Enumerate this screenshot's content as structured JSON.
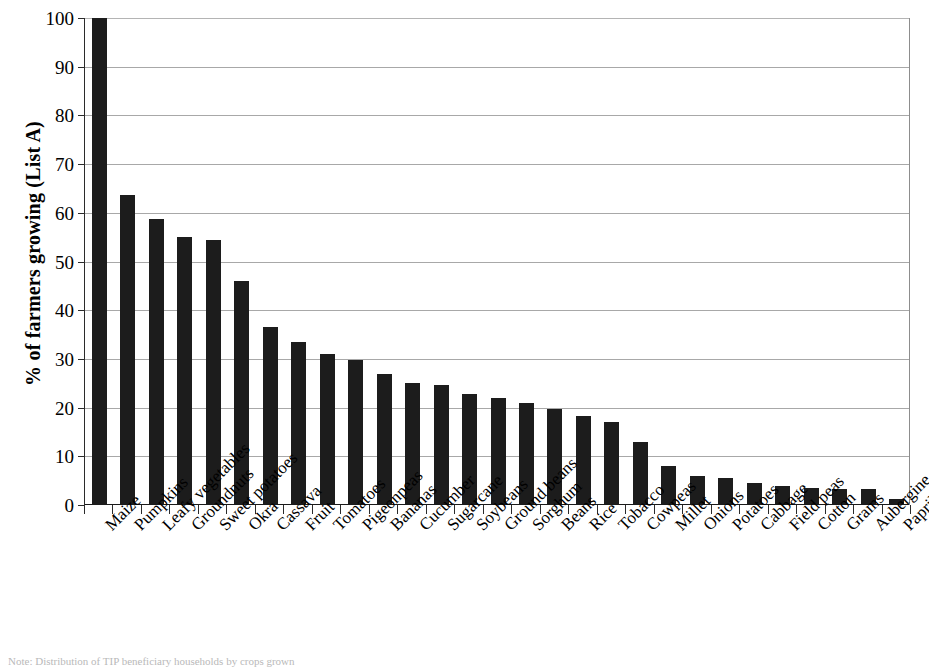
{
  "chart_data": {
    "type": "bar",
    "title": "",
    "xlabel": "",
    "ylabel": "% of farmers growing (List A)",
    "ylim": [
      0,
      100
    ],
    "yticks": [
      0,
      10,
      20,
      30,
      40,
      50,
      60,
      70,
      80,
      90,
      100
    ],
    "grid": true,
    "legend": null,
    "bar_color": "#1c1c1c",
    "categories": [
      "Maize",
      "Pumpkins",
      "Leafy vegetables",
      "Groundnuts",
      "Sweet potatoes",
      "Okra",
      "Cassava",
      "Fruit",
      "Tomatoes",
      "Pigeonpeas",
      "Bananas",
      "Cucumber",
      "Sugarcane",
      "Soybeans",
      "Ground beans",
      "Sorghum",
      "Beans",
      "Rice",
      "Tobacco",
      "Cowpeas",
      "Millet",
      "Onions",
      "Potatoes",
      "Cabbage",
      "Field peas",
      "Cotton",
      "Grams",
      "Aubergine",
      "Paprika"
    ],
    "values": [
      100,
      63.7,
      58.7,
      55.0,
      54.5,
      46.0,
      36.5,
      33.5,
      31.0,
      29.8,
      26.9,
      25.0,
      24.7,
      22.7,
      22.0,
      21.0,
      19.7,
      18.3,
      17.0,
      13.0,
      8.0,
      5.9,
      5.5,
      4.5,
      3.9,
      3.5,
      3.3,
      3.3,
      1.2
    ]
  },
  "caption": {
    "text": "Note: Distribution of TIP beneficiary households by crops grown"
  }
}
